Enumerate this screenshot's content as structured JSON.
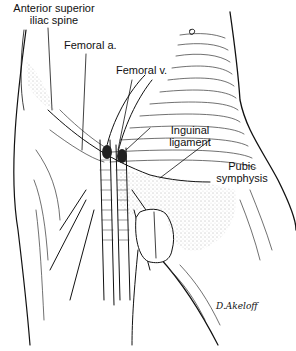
{
  "figure": {
    "labels": {
      "asis_line1": "Anterior superior",
      "asis_line2": "iliac spine",
      "femoral_artery": "Femoral a.",
      "femoral_vein": "Femoral v.",
      "inguinal_line1": "Inguinal",
      "inguinal_line2": "ligament",
      "pubic_line1": "Pubic",
      "pubic_line2": "symphysis"
    },
    "signature": "D.Akeloff",
    "colors": {
      "ink": "#111111",
      "background": "#ffffff"
    }
  }
}
